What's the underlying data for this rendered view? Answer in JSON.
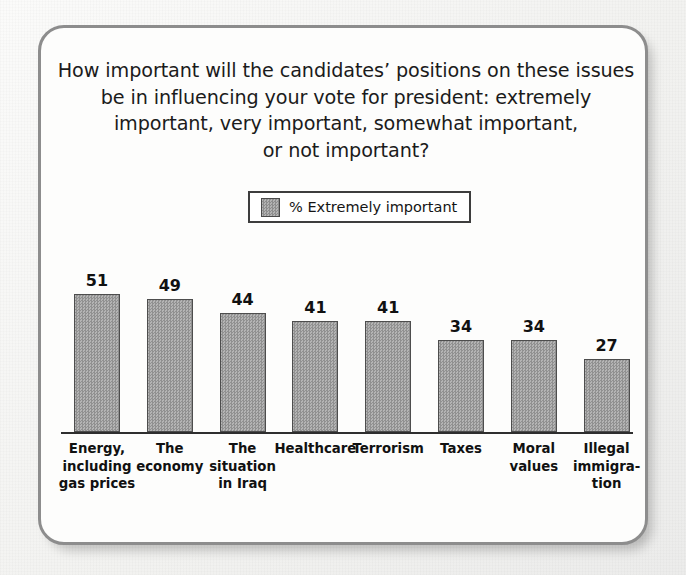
{
  "figure": {
    "title_lines": [
      "How important will the candidates’ positions on these issues",
      "be in influencing your vote for president: extremely",
      "important, very important, somewhat important,",
      "or not important?"
    ],
    "border_color": "#8d8d8d",
    "background_color": "#fdfdfc"
  },
  "legend": {
    "entries": [
      {
        "label": "% Extremely important",
        "color": "#a0a0a0",
        "swatch_icon": "legend-swatch-icon"
      }
    ]
  },
  "chart_data": {
    "type": "bar",
    "title": "How important will the candidates’ positions on these issues be in influencing your vote for president: extremely important, very important, somewhat important, or not important?",
    "categories": [
      "Energy, including gas prices",
      "The economy",
      "The situation in Iraq",
      "Healthcare",
      "Terrorism",
      "Taxes",
      "Moral values",
      "Illegal immigration"
    ],
    "category_label_lines": [
      [
        "Energy,",
        "including",
        "gas prices"
      ],
      [
        "The",
        "economy"
      ],
      [
        "The",
        "situation",
        "in Iraq"
      ],
      [
        "Healthcare"
      ],
      [
        "Terrorism"
      ],
      [
        "Taxes"
      ],
      [
        "Moral",
        "values"
      ],
      [
        "Illegal",
        "immigra-",
        "tion"
      ]
    ],
    "series": [
      {
        "name": "% Extremely important",
        "values": [
          51,
          49,
          44,
          41,
          41,
          34,
          34,
          27
        ],
        "color": "#a2a2a2"
      }
    ],
    "values": [
      51,
      49,
      44,
      41,
      41,
      34,
      34,
      27
    ],
    "value_labels": [
      "51",
      "49",
      "44",
      "41",
      "41",
      "34",
      "34",
      "27"
    ],
    "xlabel": "",
    "ylabel": "",
    "ylim": [
      0,
      51
    ],
    "grid": false,
    "axis": "baseline-only",
    "legend_position": "top-center"
  }
}
